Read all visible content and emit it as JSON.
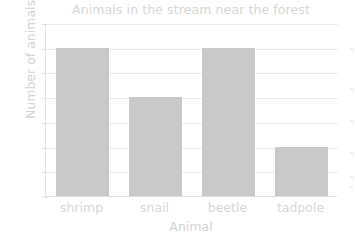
{
  "chart_data": {
    "type": "bar",
    "title": "Animals in the stream near the forest",
    "xlabel": "Animal",
    "ylabel": "Number of animals",
    "categories": [
      "shrimp",
      "snail",
      "beetle",
      "tadpole"
    ],
    "values": [
      6,
      4,
      6,
      2
    ],
    "ylim": [
      0,
      7
    ],
    "ytick_labels": [
      "0",
      "1",
      "2",
      "3",
      "4",
      "5",
      "6",
      "7"
    ],
    "ytick_values": [
      0,
      1,
      2,
      3,
      4,
      5,
      6,
      7
    ],
    "grid": true,
    "legend": false,
    "bar_color": "#c9c9c9",
    "text_color": "#d8d8d8",
    "grid_color": "#ececec",
    "axis_color": "#e2e2e2",
    "background": "#ffffff"
  }
}
